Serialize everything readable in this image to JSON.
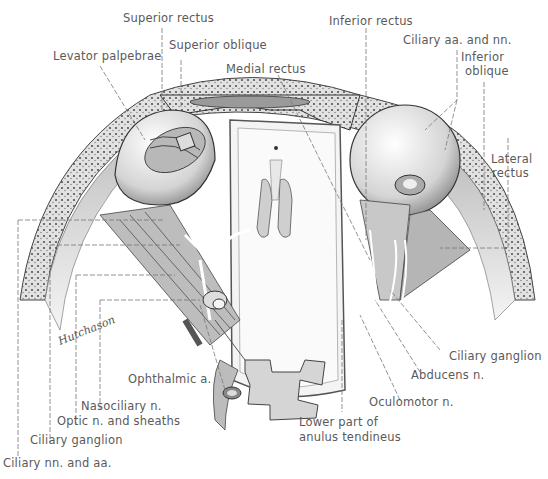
{
  "figure": {
    "type": "anatomical illustration"
  },
  "labels": {
    "superior_rectus": "Superior rectus",
    "superior_oblique": "Superior oblique",
    "levator_palpebrae": "Levator palpebrae",
    "medial_rectus": "Medial rectus",
    "inferior_rectus": "Inferior rectus",
    "ciliary_aa_nn": "Ciliary aa. and nn.",
    "inferior_oblique_1": "Inferior",
    "inferior_oblique_2": "oblique",
    "lateral_rectus_1": "Lateral",
    "lateral_rectus_2": "rectus",
    "ciliary_ganglion_right": "Ciliary ganglion",
    "abducens": "Abducens n.",
    "oculomotor": "Oculomotor n.",
    "lower_anulus_1": "Lower part of",
    "lower_anulus_2": "anulus tendineus",
    "ophthalmic": "Ophthalmic a.",
    "nasociliary": "Nasociliary n.",
    "optic": "Optic n. and sheaths",
    "ciliary_ganglion_left": "Ciliary ganglion",
    "ciliary_nn_aa": "Ciliary nn. and aa."
  },
  "signature": "Hutchason"
}
